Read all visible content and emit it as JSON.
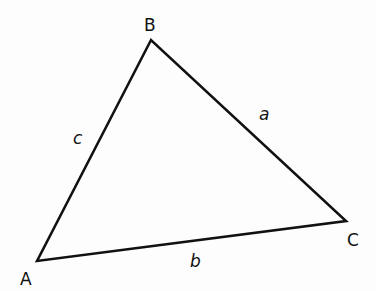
{
  "diagram": {
    "type": "triangle",
    "stroke_color": "#111111",
    "stroke_width": 2.6,
    "vertices": [
      {
        "name": "A",
        "x": 37,
        "y": 261,
        "label_x": 20,
        "label_y": 285
      },
      {
        "name": "B",
        "x": 151,
        "y": 40,
        "label_x": 144,
        "label_y": 31
      },
      {
        "name": "C",
        "x": 346,
        "y": 221,
        "label_x": 347,
        "label_y": 246
      }
    ],
    "sides": [
      {
        "name": "a",
        "from": "B",
        "to": "C",
        "label_x": 259,
        "label_y": 120
      },
      {
        "name": "b",
        "from": "A",
        "to": "C",
        "label_x": 190,
        "label_y": 267
      },
      {
        "name": "c",
        "from": "A",
        "to": "B",
        "label_x": 73,
        "label_y": 144
      }
    ]
  }
}
